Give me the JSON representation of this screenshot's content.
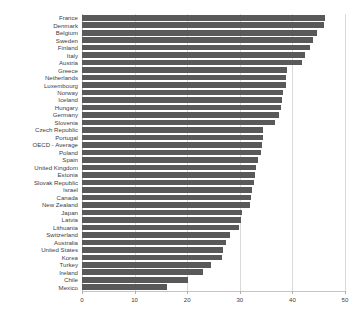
{
  "chart_data": {
    "type": "bar",
    "orientation": "horizontal",
    "title": "",
    "subtitle": "",
    "xlabel": "",
    "ylabel": "",
    "xlim": [
      0,
      50
    ],
    "ylim": null,
    "grid": "vertical",
    "legend": "none",
    "bar_color": "#595959",
    "grid_color": "#d9d9d9",
    "axis_color": "#c4c4c4",
    "tick_label_color": "#404040",
    "xticks": [
      0,
      10,
      20,
      30,
      40,
      50
    ],
    "xtick_labels": [
      "0",
      "10",
      "20",
      "30",
      "40",
      "50"
    ],
    "categories": [
      "France",
      "Denmark",
      "Belgium",
      "Sweden",
      "Finland",
      "Italy",
      "Austria",
      "Greece",
      "Netherlands",
      "Luxembourg",
      "Norway",
      "Iceland",
      "Hungary",
      "Germany",
      "Slovenia",
      "Czech Republic",
      "Portugal",
      "OECD - Average",
      "Poland",
      "Spain",
      "United Kingdom",
      "Estonia",
      "Slovak Republic",
      "Israel",
      "Canada",
      "New Zealand",
      "Japan",
      "Latvia",
      "Lithuania",
      "Switzerland",
      "Australia",
      "United States",
      "Korea",
      "Turkey",
      "Ireland",
      "Chile",
      "Mexico"
    ],
    "values": [
      46.2,
      46.0,
      44.6,
      44.0,
      43.3,
      42.4,
      41.8,
      39.0,
      38.8,
      38.7,
      38.2,
      38.0,
      37.9,
      37.5,
      36.6,
      34.5,
      34.4,
      34.2,
      34.0,
      33.5,
      33.0,
      32.9,
      32.7,
      32.3,
      32.1,
      31.9,
      30.5,
      30.2,
      29.8,
      28.2,
      27.4,
      26.9,
      26.6,
      24.6,
      23.0,
      20.1,
      16.1
    ]
  }
}
